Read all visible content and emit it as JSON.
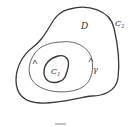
{
  "diagram": {
    "type": "region-contour-diagram",
    "labels": {
      "region": "D",
      "outer_curve": "C",
      "outer_curve_sub": "2",
      "inner_curve": "C",
      "inner_curve_sub": "1",
      "contour": "γ"
    },
    "caption": "",
    "colors": {
      "stroke": "#3a3a3a",
      "contour_stroke": "#555555",
      "background": "#ffffff"
    }
  }
}
